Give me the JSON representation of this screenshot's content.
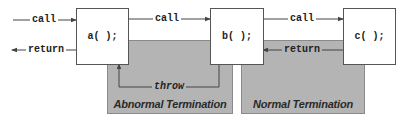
{
  "diagram": {
    "functions": [
      {
        "id": "a",
        "label": "a( );"
      },
      {
        "id": "b",
        "label": "b( );"
      },
      {
        "id": "c",
        "label": "c( );"
      }
    ],
    "edges": {
      "entry_call": "call",
      "exit_return": "return",
      "a_to_b_call": "call",
      "b_to_c_call": "call",
      "c_to_b_return": "return",
      "b_to_a_throw": "throw"
    },
    "zones": {
      "abnormal": "Abnormal Termination",
      "normal": "Normal Termination"
    },
    "colors": {
      "zone_fill": "#b4b4b4",
      "line": "#444444",
      "box_fill": "#ffffff"
    }
  }
}
